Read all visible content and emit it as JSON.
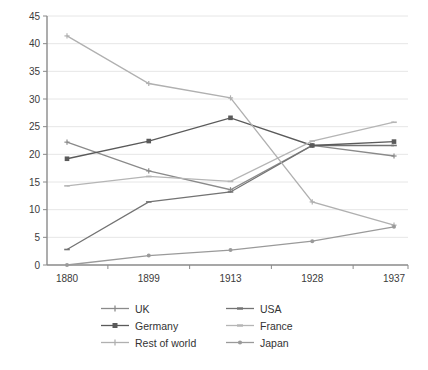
{
  "chart_data": {
    "type": "line",
    "title": "",
    "subtitle": "",
    "xlabel": "",
    "ylabel": "",
    "categories": [
      "1880",
      "1899",
      "1913",
      "1928",
      "1937"
    ],
    "ylim": [
      0,
      45
    ],
    "ytick_step": 5,
    "yticks": [
      "0",
      "5",
      "10",
      "15",
      "20",
      "25",
      "30",
      "35",
      "40",
      "45"
    ],
    "grid": true,
    "legend_position": "bottom",
    "legend_columns": 2,
    "series": [
      {
        "name": "UK",
        "color": "#8a8a8a",
        "marker": "cross",
        "values": [
          22.2,
          17.0,
          13.6,
          21.6,
          19.7
        ]
      },
      {
        "name": "USA",
        "color": "#737373",
        "marker": "dash",
        "values": [
          2.8,
          11.4,
          13.2,
          21.6,
          21.6
        ]
      },
      {
        "name": "Germany",
        "color": "#5a5a5a",
        "marker": "square",
        "values": [
          19.2,
          22.4,
          26.6,
          21.6,
          22.3
        ]
      },
      {
        "name": "France",
        "color": "#b5b5b5",
        "marker": "dash",
        "values": [
          14.3,
          16.0,
          15.1,
          22.4,
          25.8
        ]
      },
      {
        "name": "Rest of world",
        "color": "#b0b0b0",
        "marker": "cross",
        "values": [
          41.4,
          32.8,
          30.2,
          11.4,
          7.2
        ]
      },
      {
        "name": "Japan",
        "color": "#9a9a9a",
        "marker": "dot",
        "values": [
          0.0,
          1.7,
          2.7,
          4.3,
          6.9
        ]
      }
    ]
  },
  "legend": {
    "items": [
      {
        "label": "UK",
        "color": "#8a8a8a",
        "marker": "cross"
      },
      {
        "label": "USA",
        "color": "#737373",
        "marker": "dash"
      },
      {
        "label": "Germany",
        "color": "#5a5a5a",
        "marker": "square"
      },
      {
        "label": "France",
        "color": "#b5b5b5",
        "marker": "dash"
      },
      {
        "label": "Rest of world",
        "color": "#b0b0b0",
        "marker": "cross"
      },
      {
        "label": "Japan",
        "color": "#9a9a9a",
        "marker": "dot"
      }
    ]
  },
  "watermark": {
    "text": ""
  }
}
